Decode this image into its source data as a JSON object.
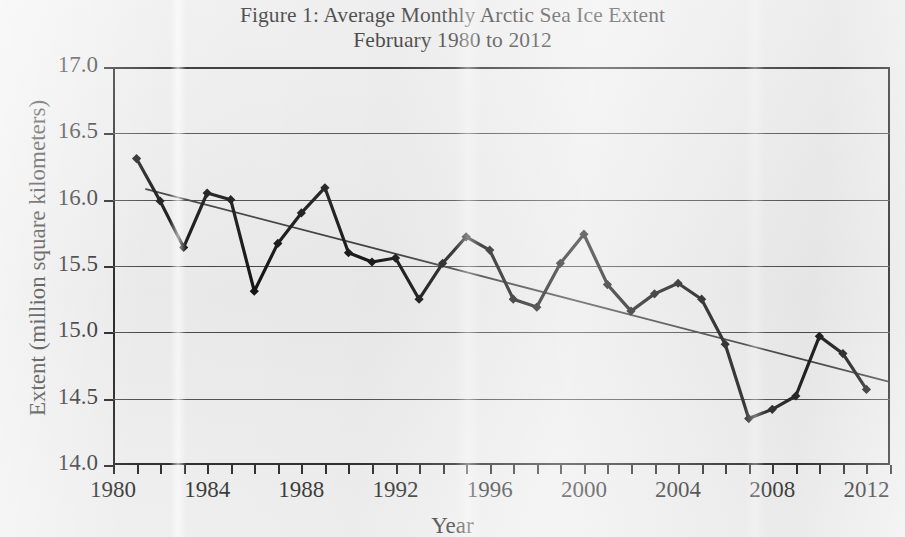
{
  "figure": {
    "title_line1": "Figure 1: Average Monthly Arctic Sea Ice Extent",
    "title_line2": "February 1980 to 2012"
  },
  "axes": {
    "ylabel": "Extent (million square kilometers)",
    "xlabel": "Year",
    "y_ticks": [
      "14.0",
      "14.5",
      "15.0",
      "15.5",
      "16.0",
      "16.5",
      "17.0"
    ],
    "x_ticks": [
      "1980",
      "1984",
      "1988",
      "1992",
      "1996",
      "2000",
      "2004",
      "2008",
      "2012"
    ]
  },
  "colors": {
    "series_line": "#141414",
    "marker": "#141414",
    "trend_line": "#3a3a3a",
    "gridline": "#444444",
    "frame": "#141414",
    "background": "#ececed"
  },
  "chart_data": {
    "type": "line",
    "title": "Figure 1: Average Monthly Arctic Sea Ice Extent February 1980 to 2012",
    "xlabel": "Year",
    "ylabel": "Extent (million square kilometers)",
    "xlim": [
      1980,
      2013
    ],
    "ylim": [
      14.0,
      17.0
    ],
    "ytick_step": 0.5,
    "xtick_major_step": 4,
    "xtick_minor_step": 1,
    "grid": "horizontal",
    "legend": "none",
    "markers": "filled-diamond",
    "x": [
      1981,
      1982,
      1983,
      1984,
      1985,
      1986,
      1987,
      1988,
      1989,
      1990,
      1991,
      1992,
      1993,
      1994,
      1995,
      1996,
      1997,
      1998,
      1999,
      2000,
      2001,
      2002,
      2003,
      2004,
      2005,
      2006,
      2007,
      2008,
      2009,
      2010,
      2011,
      2012
    ],
    "series": [
      {
        "name": "February Arctic sea ice extent",
        "values": [
          16.31,
          15.99,
          15.64,
          16.05,
          16.0,
          15.31,
          15.67,
          15.9,
          16.09,
          15.6,
          15.53,
          15.56,
          15.25,
          15.52,
          15.72,
          15.62,
          15.25,
          15.19,
          15.52,
          15.74,
          15.36,
          15.16,
          15.29,
          15.37,
          15.25,
          14.91,
          14.35,
          14.42,
          14.52,
          14.97,
          14.84,
          14.57
        ]
      }
    ],
    "trend_line": {
      "name": "Linear trend",
      "x_start": 1981.4,
      "y_start": 16.08,
      "x_end": 2012.9,
      "y_end": 14.63
    },
    "annotations": []
  }
}
